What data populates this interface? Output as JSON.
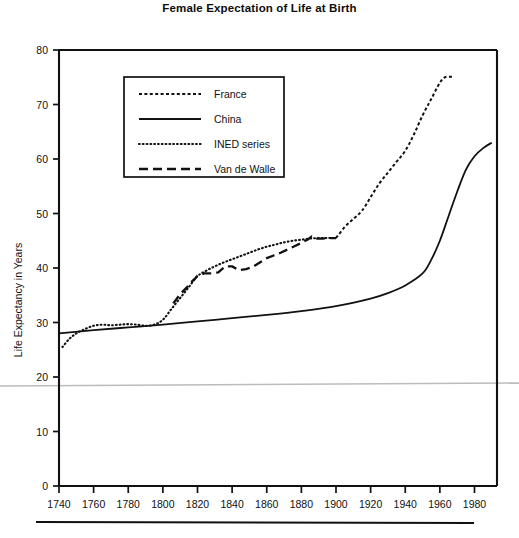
{
  "chart_data": {
    "type": "line",
    "title": "Female Expectation of Life at Birth",
    "xlabel": "",
    "ylabel": "Life Expectancy in Years",
    "xlim": [
      1740,
      1993
    ],
    "ylim": [
      0,
      80
    ],
    "xticks": [
      1740,
      1760,
      1780,
      1800,
      1820,
      1840,
      1860,
      1880,
      1900,
      1920,
      1940,
      1960,
      1980
    ],
    "yticks": [
      0,
      10,
      20,
      30,
      40,
      50,
      60,
      70,
      80
    ],
    "grid": false,
    "legend_position": "upper-left-inset",
    "series": [
      {
        "name": "France",
        "style": "fine-dashed",
        "color": "#111111",
        "points": [
          [
            1900,
            45.5
          ],
          [
            1905,
            47.5
          ],
          [
            1910,
            49.0
          ],
          [
            1915,
            50.5
          ],
          [
            1920,
            53.0
          ],
          [
            1925,
            55.5
          ],
          [
            1930,
            57.5
          ],
          [
            1935,
            59.5
          ],
          [
            1940,
            61.5
          ],
          [
            1945,
            64.5
          ],
          [
            1950,
            68.0
          ],
          [
            1955,
            71.0
          ],
          [
            1960,
            74.0
          ],
          [
            1963,
            75.0
          ],
          [
            1967,
            75.1
          ]
        ]
      },
      {
        "name": "China",
        "style": "solid",
        "color": "#111111",
        "points": [
          [
            1740,
            28.0
          ],
          [
            1760,
            28.6
          ],
          [
            1780,
            29.1
          ],
          [
            1800,
            29.6
          ],
          [
            1820,
            30.2
          ],
          [
            1840,
            30.8
          ],
          [
            1860,
            31.4
          ],
          [
            1880,
            32.1
          ],
          [
            1900,
            33.0
          ],
          [
            1920,
            34.4
          ],
          [
            1930,
            35.4
          ],
          [
            1940,
            36.8
          ],
          [
            1950,
            39.0
          ],
          [
            1955,
            41.5
          ],
          [
            1960,
            45.0
          ],
          [
            1965,
            49.5
          ],
          [
            1970,
            54.0
          ],
          [
            1975,
            58.0
          ],
          [
            1980,
            60.5
          ],
          [
            1985,
            62.0
          ],
          [
            1990,
            63.0
          ]
        ]
      },
      {
        "name": "INED series",
        "style": "dotted",
        "color": "#111111",
        "points": [
          [
            1742,
            25.5
          ],
          [
            1746,
            27.0
          ],
          [
            1750,
            28.0
          ],
          [
            1755,
            28.8
          ],
          [
            1760,
            29.4
          ],
          [
            1765,
            29.6
          ],
          [
            1770,
            29.5
          ],
          [
            1775,
            29.6
          ],
          [
            1780,
            29.7
          ],
          [
            1785,
            29.6
          ],
          [
            1790,
            29.4
          ],
          [
            1795,
            29.6
          ],
          [
            1800,
            30.5
          ],
          [
            1805,
            32.5
          ],
          [
            1810,
            34.5
          ],
          [
            1815,
            36.5
          ],
          [
            1820,
            38.5
          ],
          [
            1825,
            39.5
          ],
          [
            1830,
            40.3
          ],
          [
            1835,
            41.0
          ],
          [
            1840,
            41.6
          ],
          [
            1845,
            42.2
          ],
          [
            1850,
            42.8
          ],
          [
            1855,
            43.4
          ],
          [
            1860,
            43.9
          ],
          [
            1865,
            44.3
          ],
          [
            1870,
            44.7
          ],
          [
            1875,
            45.0
          ],
          [
            1880,
            45.2
          ],
          [
            1885,
            45.4
          ],
          [
            1890,
            45.5
          ],
          [
            1895,
            45.5
          ],
          [
            1900,
            45.5
          ]
        ]
      },
      {
        "name": "Van de Walle",
        "style": "long-dashed",
        "color": "#111111",
        "points": [
          [
            1806,
            33.5
          ],
          [
            1810,
            35.2
          ],
          [
            1814,
            36.5
          ],
          [
            1817,
            37.6
          ],
          [
            1819,
            38.2
          ],
          [
            1820,
            38.6
          ],
          [
            1824,
            39.0
          ],
          [
            1828,
            39.0
          ],
          [
            1832,
            39.2
          ],
          [
            1836,
            40.3
          ],
          [
            1840,
            40.3
          ],
          [
            1844,
            39.6
          ],
          [
            1848,
            39.8
          ],
          [
            1852,
            40.2
          ],
          [
            1856,
            41.0
          ],
          [
            1860,
            41.8
          ],
          [
            1864,
            42.3
          ],
          [
            1868,
            42.8
          ],
          [
            1872,
            43.4
          ],
          [
            1876,
            44.0
          ],
          [
            1880,
            44.6
          ],
          [
            1884,
            45.3
          ],
          [
            1886,
            45.8
          ],
          [
            1888,
            45.4
          ],
          [
            1892,
            45.4
          ],
          [
            1896,
            45.5
          ],
          [
            1900,
            45.5
          ]
        ]
      }
    ],
    "legend": [
      {
        "label": "France",
        "style": "fine-dashed"
      },
      {
        "label": "China",
        "style": "solid"
      },
      {
        "label": "INED series",
        "style": "dotted"
      },
      {
        "label": "Van de Walle",
        "style": "long-dashed"
      }
    ],
    "tick_labels_x": [
      "1740",
      "1760",
      "1780",
      "1800",
      "1820",
      "1840",
      "1860",
      "1880",
      "1900",
      "1920",
      "1940",
      "1960",
      "1980"
    ],
    "tick_labels_y": [
      "0",
      "10",
      "20",
      "30",
      "40",
      "50",
      "60",
      "70",
      "80"
    ]
  },
  "footer": {
    "rule": ""
  }
}
